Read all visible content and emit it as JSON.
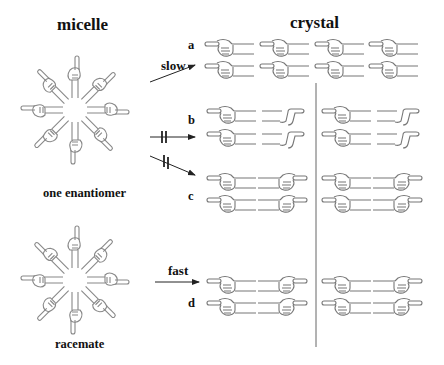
{
  "titles": {
    "micelle": "micelle",
    "crystal": "crystal"
  },
  "captions": {
    "one_enantiomer": "one enantiomer",
    "racemate": "racemate"
  },
  "row_labels": {
    "a": "a",
    "b": "b",
    "c": "c",
    "d": "d"
  },
  "arrow_labels": {
    "slow": "slow",
    "fast": "fast"
  },
  "colors": {
    "hand_stroke": "#777777",
    "text": "#111111",
    "arrow": "#222222",
    "divider": "#666666"
  },
  "diagram": {
    "micelles": [
      {
        "id": "one-enantiomer",
        "cx": 75,
        "cy": 110,
        "arms": 8
      },
      {
        "id": "racemate",
        "cx": 75,
        "cy": 280,
        "arms": 8
      }
    ],
    "divider": {
      "x": 316,
      "y1": 83,
      "y2": 347
    },
    "arrows": [
      {
        "id": "slow",
        "from": [
          150,
          82
        ],
        "to": [
          195,
          65
        ],
        "blocked": false
      },
      {
        "id": "blocked-b",
        "from": [
          150,
          137
        ],
        "to": [
          195,
          137
        ],
        "blocked": true
      },
      {
        "id": "blocked-c",
        "from": [
          150,
          155
        ],
        "to": [
          195,
          175
        ],
        "blocked": true
      },
      {
        "id": "fast",
        "from": [
          155,
          282
        ],
        "to": [
          200,
          282
        ],
        "blocked": false
      }
    ],
    "crystal_rows": [
      {
        "row": "a",
        "pattern": "all-left-pointing",
        "ys": [
          46,
          68
        ]
      },
      {
        "row": "b",
        "pattern": "left-hand-and-flat-hand",
        "ys": [
          113,
          137
        ]
      },
      {
        "row": "c",
        "pattern": "left-hand-and-right-hand",
        "ys": [
          180,
          202
        ]
      },
      {
        "row": "d",
        "pattern": "left-hand-and-right-hand",
        "ys": [
          282,
          304
        ]
      }
    ]
  }
}
